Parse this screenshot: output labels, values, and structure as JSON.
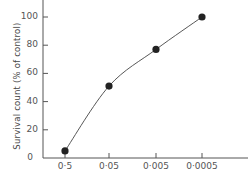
{
  "chart_data": {
    "type": "line",
    "title": "",
    "xlabel": "",
    "ylabel": "Survival count (% of control)",
    "categories": [
      "0·5",
      "0·05",
      "0·005",
      "0·0005"
    ],
    "series": [
      {
        "name": "Survival count",
        "values": [
          5,
          51,
          77,
          100
        ],
        "marker": "filled-circle",
        "color": "#222222"
      }
    ],
    "yticks": [
      "0",
      "20",
      "40",
      "60",
      "80",
      "100"
    ],
    "ylim": [
      0,
      110
    ],
    "grid": false,
    "legend": null,
    "line_style": "smooth curve through points"
  }
}
